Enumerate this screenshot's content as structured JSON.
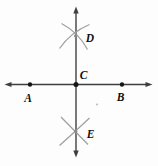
{
  "diagram": {
    "points": {
      "a": {
        "label": "A"
      },
      "b": {
        "label": "B"
      },
      "c": {
        "label": "C"
      },
      "d": {
        "label": "D"
      },
      "e": {
        "label": "E"
      }
    },
    "colors": {
      "background": "#fdfdfd",
      "line": "#3f3f3f",
      "arc": "#9e9e9e",
      "dot": "#161616",
      "crossing_dot": "#8a8a8a",
      "label": "#101010",
      "speck": "#bfbfbf"
    }
  }
}
